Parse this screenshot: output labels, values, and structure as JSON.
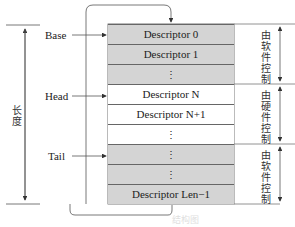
{
  "pointers": {
    "base": "Base",
    "head": "Head",
    "tail": "Tail"
  },
  "length_label": "长度",
  "cells": [
    {
      "label": "Descriptor 0",
      "shade": "gray"
    },
    {
      "label": "Descriptor 1",
      "shade": "gray"
    },
    {
      "label": "⋮",
      "shade": "gray"
    },
    {
      "label": "Descriptor N",
      "shade": "white"
    },
    {
      "label": "Descriptor N+1",
      "shade": "white"
    },
    {
      "label": "⋮",
      "shade": "white"
    },
    {
      "label": "⋮",
      "shade": "gray"
    },
    {
      "label": "⋮",
      "shade": "gray"
    },
    {
      "label": "Descriptor Len−1",
      "shade": "gray"
    }
  ],
  "regions": {
    "software_top": "由软件控制",
    "hardware": "由硬件控制",
    "software_bottom": "由软件控制"
  },
  "caption": "结构图",
  "colors": {
    "software_fill": "#d4d4d4",
    "hardware_fill": "#ffffff",
    "line": "#555555"
  }
}
